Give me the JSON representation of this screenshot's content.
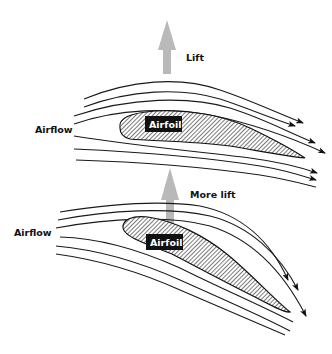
{
  "diagram": {
    "type": "airflow-over-airfoil",
    "colors": {
      "lift_arrow": "#b9b9b9",
      "streamline": "#1a1a1a",
      "label_box": "#111111",
      "background": "#ffffff"
    },
    "panels": [
      {
        "name": "normal-angle",
        "lift_label": "Lift",
        "airflow_label": "Airflow",
        "airfoil_label": "Airfoil"
      },
      {
        "name": "increased-angle",
        "lift_label": "More lift",
        "airflow_label": "Airflow",
        "airfoil_label": "Airfoil"
      }
    ]
  }
}
